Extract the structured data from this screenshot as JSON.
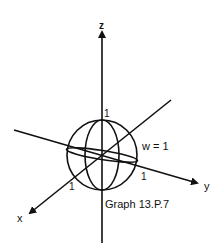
{
  "diagram": {
    "caption": "Graph 13.P.7",
    "axes": {
      "x_label": "x",
      "y_label": "y",
      "z_label": "z"
    },
    "tick_labels": {
      "z_unit": "1",
      "y_unit": "1",
      "x_unit": "1"
    },
    "annotation": "w = 1",
    "colors": {
      "stroke": "#111111",
      "background": "#ffffff"
    }
  }
}
